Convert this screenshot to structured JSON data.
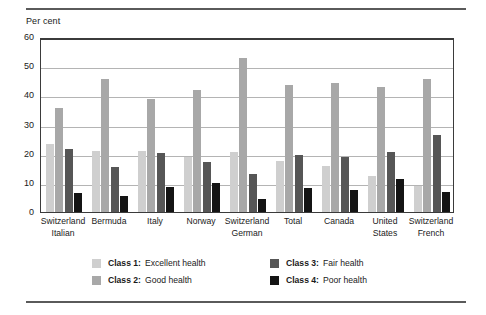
{
  "chart_data": {
    "type": "bar",
    "title": "",
    "ylabel": "Per cent",
    "xlabel": "",
    "ylim": [
      0,
      60
    ],
    "yticks": [
      0,
      10,
      20,
      30,
      40,
      50,
      60
    ],
    "grid": true,
    "legend_position": "bottom",
    "categories": [
      "Switzerland Italian",
      "Bermuda",
      "Italy",
      "Norway",
      "Switzerland German",
      "Total",
      "Canada",
      "United States",
      "Switzerland French"
    ],
    "category_lines": [
      [
        "Switzerland",
        "Italian"
      ],
      [
        "Bermuda",
        ""
      ],
      [
        "Italy",
        ""
      ],
      [
        "Norway",
        ""
      ],
      [
        "Switzerland",
        "German"
      ],
      [
        "Total",
        ""
      ],
      [
        "Canada",
        ""
      ],
      [
        "United",
        "States"
      ],
      [
        "Switzerland",
        "French"
      ]
    ],
    "series": [
      {
        "name": "Class 1",
        "label": "Class 1: Excellent health",
        "color": "#cfcfcf",
        "values": [
          23.2,
          20.9,
          21.0,
          18.8,
          20.6,
          17.6,
          15.8,
          12.5,
          9.0
        ]
      },
      {
        "name": "Class 2",
        "label": "Class 2: Good health",
        "color": "#a8a8a8",
        "values": [
          35.6,
          45.5,
          38.8,
          42.0,
          52.7,
          43.7,
          44.3,
          43.0,
          45.5
        ]
      },
      {
        "name": "Class 3",
        "label": "Class 3: Fair health",
        "color": "#565656",
        "values": [
          21.6,
          15.6,
          20.2,
          17.3,
          13.0,
          19.7,
          19.0,
          20.5,
          26.5
        ]
      },
      {
        "name": "Class 4",
        "label": "Class 4: Poor health",
        "color": "#141414",
        "values": [
          6.6,
          5.5,
          8.5,
          10.0,
          4.5,
          8.2,
          7.6,
          11.3,
          7.0
        ]
      }
    ]
  },
  "legend": {
    "items": [
      {
        "key": "Class 1:",
        "value": "Excellent health",
        "color": "#cfcfcf"
      },
      {
        "key": "Class 2:",
        "value": "Good health",
        "color": "#a8a8a8"
      },
      {
        "key": "Class 3:",
        "value": "Fair health",
        "color": "#565656"
      },
      {
        "key": "Class 4:",
        "value": "Poor health",
        "color": "#141414"
      }
    ]
  }
}
